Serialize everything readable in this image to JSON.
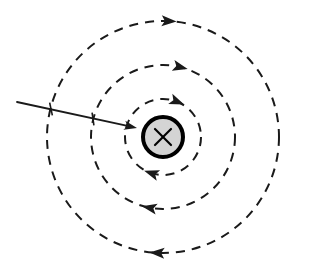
{
  "figure": {
    "width": 317,
    "height": 274,
    "background_color": "#ffffff",
    "stroke_color": "#1a1a1a"
  },
  "wire": {
    "label": "current-into-page-wire",
    "symbol": "x",
    "center_x": 163,
    "center_y": 137,
    "radius": 20,
    "fill_color": "#d4d4d4",
    "border_color": "#000000",
    "border_width": 4,
    "cross_half_size": 8,
    "cross_stroke_width": 2.2
  },
  "field_lines": {
    "direction": "clockwise",
    "dash_pattern": "9 7",
    "stroke_width": 2.0,
    "stroke_color": "#1a1a1a",
    "circles": [
      {
        "name": "inner-field-line",
        "radius": 38,
        "top_arrow_angle_deg": -68,
        "bottom_arrow_angle_deg": 108
      },
      {
        "name": "middle-field-line",
        "radius": 72,
        "top_arrow_angle_deg": -76,
        "bottom_arrow_angle_deg": 101
      },
      {
        "name": "outer-field-line",
        "radius": 116,
        "top_arrow_angle_deg": -87,
        "bottom_arrow_angle_deg": 93
      }
    ]
  },
  "velocity_arrow": {
    "name": "incoming-arrow",
    "start_x": 17,
    "start_y": 102,
    "end_x": 137,
    "end_y": 128,
    "stroke_width": 1.8,
    "head_length": 13,
    "head_width": 9
  },
  "tick_marks": [
    {
      "name": "tick-on-outer-circle",
      "x": 51,
      "y": 109,
      "length": 13,
      "angle_deg": 78
    },
    {
      "name": "tick-on-middle-circle",
      "x": 93,
      "y": 119,
      "length": 13,
      "angle_deg": 82
    }
  ]
}
